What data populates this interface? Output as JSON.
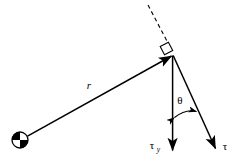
{
  "figure": {
    "background_color": "#ffffff",
    "stroke_color": "#000000",
    "width": 242,
    "height": 164
  },
  "labels": {
    "radius": "r",
    "torque": "τ",
    "torque_y_base": "τ",
    "torque_y_sub": "y",
    "angle": "θ"
  },
  "elements": {
    "pivot_name": "pivot-point",
    "radius_vector_name": "radius-vector",
    "torque_vector_name": "torque-vector",
    "torque_y_vector_name": "torque-y-vector",
    "dashed_extension_name": "dashed-extension-line",
    "right_angle_name": "right-angle-marker",
    "angle_arc_name": "angle-arc"
  },
  "geometry": {
    "pivot": {
      "cx": 20,
      "cy": 140,
      "r": 8
    },
    "apex": {
      "x": 173,
      "y": 55
    },
    "radius_start": {
      "x": 27,
      "y": 136
    },
    "torque_y_end": {
      "x": 173,
      "y": 151
    },
    "torque_end": {
      "x": 216,
      "y": 149
    },
    "dashed_start": {
      "x": 148,
      "y": 5
    },
    "dashed_end": {
      "x": 167,
      "y": 42
    },
    "right_angle_marker": {
      "x": 164,
      "y": 50,
      "size": 9,
      "rotation": -26
    },
    "angle_arc": {
      "from": {
        "x": 173,
        "y": 117
      },
      "to": {
        "x": 197,
        "y": 110
      }
    }
  },
  "label_positions": {
    "radius": {
      "x": 89,
      "y": 89
    },
    "angle": {
      "x": 176,
      "y": 104
    },
    "torque_y": {
      "x": 152,
      "y": 148
    },
    "torque": {
      "x": 224,
      "y": 149
    }
  }
}
